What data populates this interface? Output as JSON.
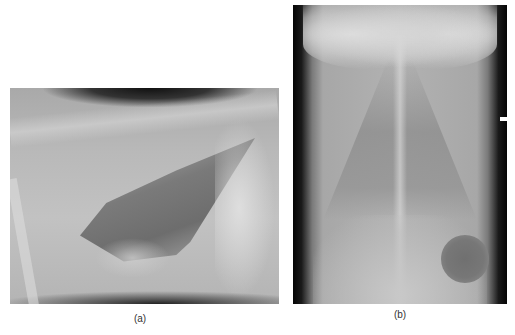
{
  "figure": {
    "panels": [
      {
        "id": "a",
        "label": "(a)",
        "description": "Lateral thoracic radiograph",
        "view": "lateral"
      },
      {
        "id": "b",
        "label": "(b)",
        "description": "Ventrodorsal thoracic radiograph",
        "view": "ventrodorsal"
      }
    ]
  }
}
